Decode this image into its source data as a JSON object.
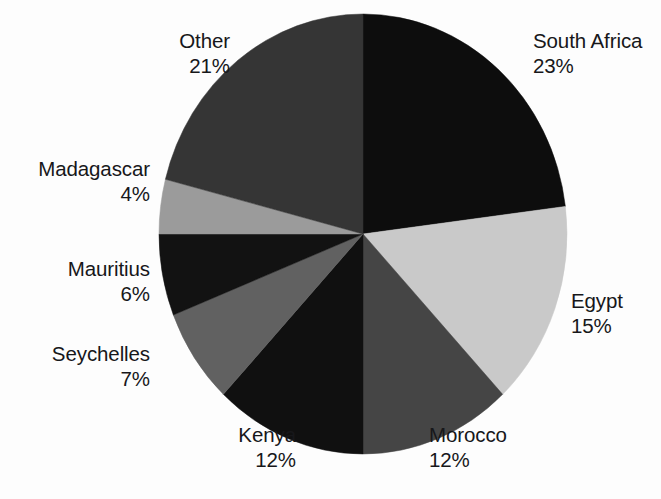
{
  "chart_data": {
    "type": "pie",
    "title": "",
    "subtitle": "",
    "xlabel": "",
    "ylabel": "",
    "legend_position": "none",
    "grid": false,
    "unit": "%",
    "start_angle_deg": 0,
    "direction": "clockwise",
    "total": 100,
    "categories": [
      "South Africa",
      "Egypt",
      "Morocco",
      "Kenya",
      "Seychelles",
      "Mauritius",
      "Madagascar",
      "Other"
    ],
    "values": [
      23,
      15,
      12,
      12,
      7,
      6,
      4,
      21
    ],
    "slices": [
      {
        "label": "South Africa",
        "value": 23,
        "pct_text": "23%",
        "color": "#0d0d0d"
      },
      {
        "label": "Egypt",
        "value": 15,
        "pct_text": "15%",
        "color": "#c9c9c9"
      },
      {
        "label": "Morocco",
        "value": 12,
        "pct_text": "12%",
        "color": "#454545"
      },
      {
        "label": "Kenya",
        "value": 12,
        "pct_text": "12%",
        "color": "#101010"
      },
      {
        "label": "Seychelles",
        "value": 7,
        "pct_text": "7%",
        "color": "#616161"
      },
      {
        "label": "Mauritius",
        "value": 6,
        "pct_text": "6%",
        "color": "#121212"
      },
      {
        "label": "Madagascar",
        "value": 4,
        "pct_text": "4%",
        "color": "#9b9b9b"
      },
      {
        "label": "Other",
        "value": 21,
        "pct_text": "21%",
        "color": "#353535"
      }
    ]
  },
  "labels": {
    "other": {
      "name": "Other",
      "pct": "21%"
    },
    "south_africa": {
      "name": "South Africa",
      "pct": "23%"
    },
    "madagascar": {
      "name": "Madagascar",
      "pct": "4%"
    },
    "mauritius": {
      "name": "Mauritius",
      "pct": "6%"
    },
    "seychelles": {
      "name": "Seychelles",
      "pct": "7%"
    },
    "egypt": {
      "name": "Egypt",
      "pct": "15%"
    },
    "kenya": {
      "name": "Kenya",
      "pct": "12%"
    },
    "morocco": {
      "name": "Morocco",
      "pct": "12%"
    }
  },
  "colors": {
    "text": "#17171a",
    "background": "#fdfdfd"
  }
}
